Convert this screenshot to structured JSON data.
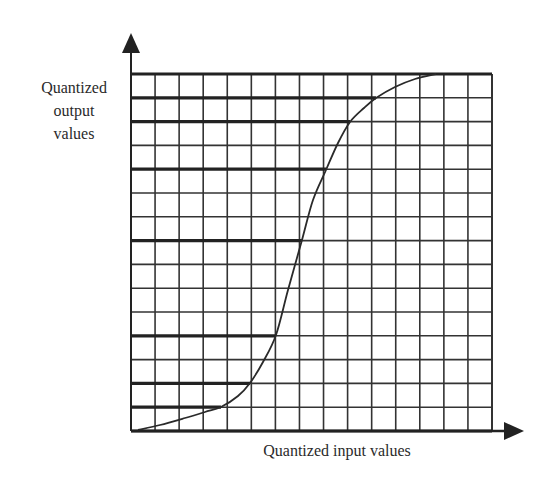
{
  "figure": {
    "type": "quantization-transfer-curve",
    "y_axis_label_lines": [
      "Quantized",
      "output",
      "values"
    ],
    "x_axis_label": "Quantized input values",
    "grid": {
      "columns": 15,
      "rows": 15,
      "left": 131,
      "top": 74,
      "right": 492,
      "bottom": 431,
      "thin_line_color": "#333333",
      "thick_line_color": "#222222"
    },
    "quantization_levels": [
      {
        "row_index": 0,
        "extends_to_x": 492
      },
      {
        "row_index": 1,
        "extends_to_x": 376
      },
      {
        "row_index": 2,
        "extends_to_x": 350
      },
      {
        "row_index": 4,
        "extends_to_x": 326
      },
      {
        "row_index": 7,
        "extends_to_x": 302
      },
      {
        "row_index": 11,
        "extends_to_x": 276
      },
      {
        "row_index": 13,
        "extends_to_x": 250
      },
      {
        "row_index": 14,
        "extends_to_x": 221
      },
      {
        "row_index": 15,
        "extends_to_x": 492
      }
    ],
    "curve_points": [
      [
        138,
        430
      ],
      [
        160,
        425
      ],
      [
        185,
        418
      ],
      [
        205,
        412
      ],
      [
        221,
        407
      ],
      [
        238,
        396
      ],
      [
        250,
        383
      ],
      [
        263,
        362
      ],
      [
        276,
        335
      ],
      [
        288,
        290
      ],
      [
        302,
        240
      ],
      [
        313,
        200
      ],
      [
        326,
        170
      ],
      [
        338,
        143
      ],
      [
        350,
        122
      ],
      [
        364,
        108
      ],
      [
        376,
        98
      ],
      [
        395,
        87
      ],
      [
        415,
        79
      ],
      [
        436,
        74
      ]
    ],
    "y_axis_arrow": {
      "x": 131,
      "tip_y": 33
    },
    "x_axis_arrow": {
      "y": 431,
      "tip_x": 524
    },
    "bleed_through_text": [
      "",
      "",
      ""
    ]
  }
}
